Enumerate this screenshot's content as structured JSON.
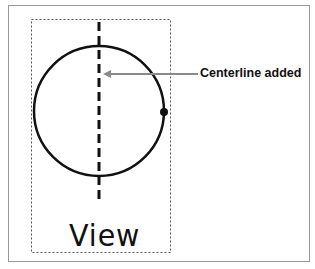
{
  "diagram": {
    "callout_label": "Centerline added",
    "view_label": "View",
    "colors": {
      "stroke": "#111111",
      "arrow": "#8a8a8a",
      "frame": "#9a9a9a",
      "dashed_box": "#555555"
    },
    "circle": {
      "cx": 99,
      "cy": 111,
      "r": 65
    },
    "centerline": {
      "x": 99,
      "y1": 22,
      "y2": 200
    },
    "point": {
      "x": 164,
      "y": 112
    }
  }
}
